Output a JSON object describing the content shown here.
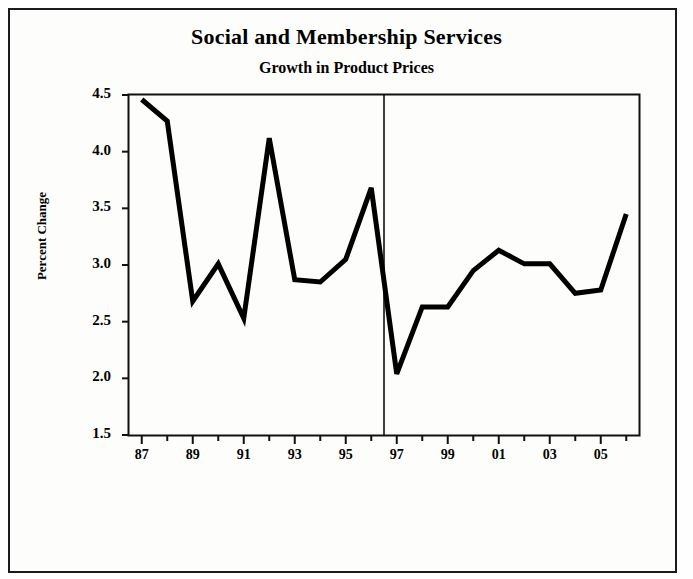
{
  "chart_data": {
    "type": "line",
    "title": "Social and Membership Services",
    "subtitle": "Growth in Product Prices",
    "xlabel": "",
    "ylabel": "Percent Change",
    "ylim": [
      1.5,
      4.5
    ],
    "ytick_labels": [
      "1.5",
      "2.0",
      "2.5",
      "3.0",
      "3.5",
      "4.0",
      "4.5"
    ],
    "ytick_values": [
      1.5,
      2.0,
      2.5,
      3.0,
      3.5,
      4.0,
      4.5
    ],
    "xtick_labels": [
      "87",
      "89",
      "91",
      "93",
      "95",
      "97",
      "99",
      "01",
      "03",
      "05"
    ],
    "xtick_values": [
      1987,
      1989,
      1991,
      1993,
      1995,
      1997,
      1999,
      2001,
      2003,
      2005
    ],
    "xlim": [
      1986.5,
      2006.5
    ],
    "grid": false,
    "legend": "none",
    "line_color": "#000000",
    "line_width": 5,
    "reference_line": {
      "x": 1996.5,
      "label": "",
      "color": "#000000",
      "width": 1.5
    },
    "x": [
      1987,
      1988,
      1989,
      1990,
      1991,
      1992,
      1993,
      1994,
      1995,
      1996,
      1997,
      1998,
      1999,
      2000,
      2001,
      2002,
      2003,
      2004,
      2005,
      2006
    ],
    "values": [
      4.46,
      4.27,
      2.68,
      3.01,
      2.53,
      4.12,
      2.87,
      2.85,
      3.05,
      3.68,
      2.04,
      2.63,
      2.63,
      2.95,
      3.13,
      3.01,
      3.01,
      2.75,
      2.78,
      3.45
    ],
    "series": [
      {
        "name": "Percent Change",
        "values": [
          4.46,
          4.27,
          2.68,
          3.01,
          2.53,
          4.12,
          2.87,
          2.85,
          3.05,
          3.68,
          2.04,
          2.63,
          2.63,
          2.95,
          3.13,
          3.01,
          3.01,
          2.75,
          2.78,
          3.45
        ]
      }
    ]
  }
}
